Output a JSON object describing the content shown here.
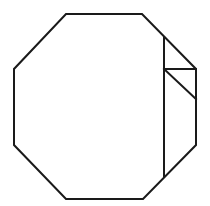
{
  "diagram": {
    "type": "geometric-figure",
    "stroke_color": "#1a1a1a",
    "background": "#ffffff",
    "octagon": {
      "points": [
        [
          66,
          14
        ],
        [
          142,
          14
        ],
        [
          196,
          69
        ],
        [
          196,
          145
        ],
        [
          143,
          199
        ],
        [
          66,
          199
        ],
        [
          14,
          145
        ],
        [
          14,
          69
        ]
      ]
    },
    "fold_lines": [
      {
        "name": "vertical-fold",
        "x1": 164,
        "y1": 38,
        "x2": 164,
        "y2": 176
      },
      {
        "name": "horizontal-fold",
        "x1": 164,
        "y1": 69,
        "x2": 196,
        "y2": 69
      },
      {
        "name": "diagonal-fold",
        "x1": 164,
        "y1": 69,
        "x2": 196,
        "y2": 99
      }
    ]
  }
}
